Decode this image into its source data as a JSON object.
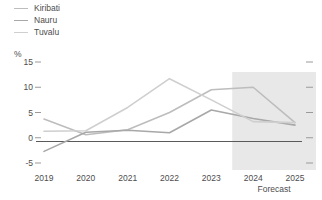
{
  "legend": {
    "items": [
      {
        "label": "Kiribati",
        "color": "#bdbdbd"
      },
      {
        "label": "Nauru",
        "color": "#a8a8a8"
      },
      {
        "label": "Tuvalu",
        "color": "#cfcfcf"
      }
    ]
  },
  "axis": {
    "y_unit": "%",
    "y_ticks": [
      "15",
      "10",
      "5",
      "0",
      "-5"
    ],
    "x_ticks": [
      "2019",
      "2020",
      "2021",
      "2022",
      "2023",
      "2024",
      "2025"
    ]
  },
  "annotations": {
    "forecast_label": "Forecast"
  },
  "colors": {
    "zero_line": "#5a5a5a",
    "forecast_band": "#e8e8e8",
    "tick": "#9a9a9a",
    "text": "#4d4d4d"
  },
  "chart_data": {
    "type": "line",
    "title": "",
    "xlabel": "",
    "ylabel": "%",
    "x": [
      2019,
      2020,
      2021,
      2022,
      2023,
      2024,
      2025
    ],
    "categories": [
      "2019",
      "2020",
      "2021",
      "2022",
      "2023",
      "2024",
      "2025"
    ],
    "ylim": [
      -5,
      15
    ],
    "y_ticks": [
      15,
      10,
      5,
      0,
      -5
    ],
    "grid": false,
    "legend_position": "top-left",
    "series": [
      {
        "name": "Kiribati",
        "color": "#bdbdbd",
        "values": [
          3.7,
          0.6,
          1.6,
          5.0,
          9.5,
          10.0,
          3.0
        ]
      },
      {
        "name": "Nauru",
        "color": "#a8a8a8",
        "values": [
          -2.7,
          1.1,
          1.5,
          1.0,
          5.5,
          3.8,
          2.5
        ]
      },
      {
        "name": "Tuvalu",
        "color": "#cfcfcf",
        "values": [
          1.3,
          1.4,
          6.0,
          11.7,
          7.5,
          3.2,
          3.0
        ]
      }
    ],
    "annotations": [
      {
        "text": "Forecast",
        "type": "band-label",
        "x_from": 2023.5,
        "x_to": 2025.5
      }
    ]
  }
}
